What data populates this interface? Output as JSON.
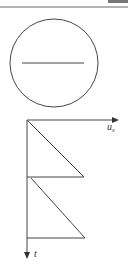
{
  "figure": {
    "top_rule": {
      "y": 7,
      "color": "#555555"
    },
    "top_block": {
      "x": 108,
      "y": 0,
      "w": 20,
      "h": 3,
      "color": "#666666"
    },
    "circle": {
      "cx": 54,
      "cy": 63,
      "r": 44,
      "stroke": "#444444"
    },
    "inner_line": {
      "x1": 22,
      "x2": 84,
      "y": 63
    },
    "axes": {
      "origin": {
        "x": 27,
        "y": 120
      },
      "x_axis": {
        "label_main": "u",
        "label_sub": "x",
        "end_x": 118
      },
      "y_axis": {
        "label": "t",
        "end_y": 258
      }
    },
    "sawtooth": [
      {
        "x1": 27,
        "y1": 120,
        "x2": 84,
        "y2": 177
      },
      {
        "x1": 27,
        "y1": 177,
        "x2": 84,
        "y2": 177
      },
      {
        "x1": 31,
        "y1": 178,
        "x2": 85,
        "y2": 238
      },
      {
        "x1": 27,
        "y1": 238,
        "x2": 85,
        "y2": 238
      }
    ],
    "line_color": "#444444"
  }
}
